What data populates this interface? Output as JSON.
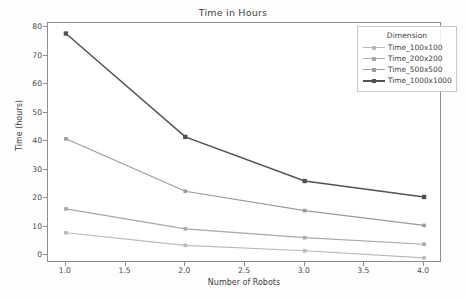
{
  "chart_data": {
    "type": "line",
    "title": "Time in Hours",
    "xlabel": "Number of Robots",
    "ylabel": "Time (hours)",
    "x": [
      1.0,
      2.0,
      3.0,
      4.0
    ],
    "xlim": [
      0.85,
      4.15
    ],
    "ylim": [
      -2.8,
      81.5
    ],
    "grid": false,
    "legend_position": "upper right",
    "legend_title": "Dimension",
    "xticks": [
      "1.0",
      "1.5",
      "2.0",
      "2.5",
      "3.0",
      "3.5",
      "4.0"
    ],
    "xtick_values": [
      1.0,
      1.5,
      2.0,
      2.5,
      3.0,
      3.5,
      4.0
    ],
    "yticks": [
      "0",
      "10",
      "20",
      "30",
      "40",
      "50",
      "60",
      "70",
      "80"
    ],
    "ytick_values": [
      0,
      10,
      20,
      30,
      40,
      50,
      60,
      70,
      80
    ],
    "series": [
      {
        "name": "Time_100x100",
        "color": "#b9b9b9",
        "values": [
          7.8,
          3.4,
          1.5,
          -1.0
        ]
      },
      {
        "name": "Time_200x200",
        "color": "#a8a8a8",
        "values": [
          16.2,
          9.2,
          6.1,
          3.8
        ]
      },
      {
        "name": "Time_500x500",
        "color": "#9a9a9a",
        "values": [
          40.8,
          22.4,
          15.6,
          10.4
        ]
      },
      {
        "name": "Time_1000x1000",
        "color": "#515151",
        "values": [
          77.8,
          41.5,
          26.0,
          20.4
        ]
      }
    ]
  }
}
